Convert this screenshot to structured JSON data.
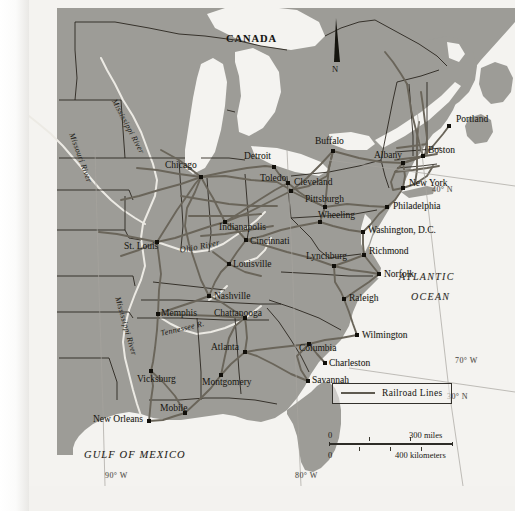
{
  "map": {
    "title_region": "Eastern United States Railroad Network",
    "colors": {
      "land": "#9d9c97",
      "water": "#f4f3f0",
      "railroad": "#6a655a",
      "border": "#231f18",
      "river": "#efeee9",
      "text": "#16150f"
    }
  },
  "labels": {
    "country": "CANADA",
    "ocean_line1": "ATLANTIC",
    "ocean_line2": "OCEAN",
    "gulf": "GULF OF MEXICO",
    "north": "N"
  },
  "rivers": [
    {
      "name": "Mississippi River",
      "x": 88,
      "y": 98,
      "rot": 62,
      "size": 8
    },
    {
      "name": "Missouri River",
      "x": 46,
      "y": 132,
      "rot": 70,
      "size": 8
    },
    {
      "name": "Mississippi River",
      "x": 92,
      "y": 296,
      "rot": 74,
      "size": 8
    },
    {
      "name": "Ohio River",
      "x": 150,
      "y": 246,
      "rot": -11,
      "size": 8.5
    },
    {
      "name": "Tennessee R.",
      "x": 131,
      "y": 330,
      "rot": -13,
      "size": 8
    }
  ],
  "graticule": [
    {
      "label": "40° N",
      "x": 432,
      "y": 186
    },
    {
      "label": "30° N",
      "x": 447,
      "y": 393
    },
    {
      "label": "70° W",
      "x": 455,
      "y": 357
    },
    {
      "label": "80° W",
      "x": 295,
      "y": 472
    },
    {
      "label": "90° W",
      "x": 105,
      "y": 472
    }
  ],
  "cities": [
    {
      "name": "Chicago",
      "lx": 136,
      "ly": 166,
      "dx": 172,
      "dy": 177
    },
    {
      "name": "Detroit",
      "lx": 215,
      "ly": 157,
      "dx": 245,
      "dy": 167
    },
    {
      "name": "Toledo",
      "lx": 231,
      "ly": 179,
      "dx": 259,
      "dy": 183
    },
    {
      "name": "Cleveland",
      "lx": 265,
      "ly": 183,
      "dx": 262,
      "dy": 191
    },
    {
      "name": "Buffalo",
      "lx": 286,
      "ly": 142,
      "dx": 304,
      "dy": 151
    },
    {
      "name": "Albany",
      "lx": 345,
      "ly": 156,
      "dx": 374,
      "dy": 163
    },
    {
      "name": "Portland",
      "lx": 427,
      "ly": 120,
      "dx": 420,
      "dy": 126
    },
    {
      "name": "Boston",
      "lx": 399,
      "ly": 151,
      "dx": 394,
      "dy": 156
    },
    {
      "name": "New York",
      "lx": 380,
      "ly": 184,
      "dx": 374,
      "dy": 188
    },
    {
      "name": "Philadelphia",
      "lx": 364,
      "ly": 207,
      "dx": 358,
      "dy": 207
    },
    {
      "name": "Pittsburgh",
      "lx": 276,
      "ly": 200,
      "dx": 296,
      "dy": 207
    },
    {
      "name": "Wheeling",
      "lx": 289,
      "ly": 216,
      "dx": 291,
      "dy": 222
    },
    {
      "name": "Washington, D.C.",
      "lx": 339,
      "ly": 231,
      "dx": 334,
      "dy": 232
    },
    {
      "name": "Richmond",
      "lx": 340,
      "ly": 252,
      "dx": 335,
      "dy": 255
    },
    {
      "name": "Norfolk",
      "lx": 355,
      "ly": 275,
      "dx": 350,
      "dy": 274
    },
    {
      "name": "Lynchburg",
      "lx": 277,
      "ly": 257,
      "dx": 305,
      "dy": 266
    },
    {
      "name": "Raleigh",
      "lx": 320,
      "ly": 299,
      "dx": 315,
      "dy": 299
    },
    {
      "name": "Wilmington",
      "lx": 333,
      "ly": 336,
      "dx": 328,
      "dy": 335
    },
    {
      "name": "Columbia",
      "lx": 270,
      "ly": 349,
      "dx": 280,
      "dy": 344
    },
    {
      "name": "Charleston",
      "lx": 300,
      "ly": 364,
      "dx": 296,
      "dy": 363
    },
    {
      "name": "Savannah",
      "lx": 283,
      "ly": 381,
      "dx": 279,
      "dy": 381
    },
    {
      "name": "Atlanta",
      "lx": 182,
      "ly": 348,
      "dx": 216,
      "dy": 352
    },
    {
      "name": "Chattanooga",
      "lx": 185,
      "ly": 314,
      "dx": 216,
      "dy": 318
    },
    {
      "name": "Nashville",
      "lx": 185,
      "ly": 297,
      "dx": 180,
      "dy": 296
    },
    {
      "name": "Memphis",
      "lx": 132,
      "ly": 314,
      "dx": 129,
      "dy": 314
    },
    {
      "name": "Vicksburg",
      "lx": 108,
      "ly": 380,
      "dx": 122,
      "dy": 371
    },
    {
      "name": "Montgomery",
      "lx": 173,
      "ly": 383,
      "dx": 192,
      "dy": 375
    },
    {
      "name": "Mobile",
      "lx": 131,
      "ly": 409,
      "dx": 156,
      "dy": 413
    },
    {
      "name": "New Orleans",
      "lx": 64,
      "ly": 420,
      "dx": 120,
      "dy": 421
    },
    {
      "name": "Louisville",
      "lx": 204,
      "ly": 265,
      "dx": 200,
      "dy": 264
    },
    {
      "name": "Cincinnati",
      "lx": 221,
      "ly": 242,
      "dx": 217,
      "dy": 240
    },
    {
      "name": "Indianapolis",
      "lx": 190,
      "ly": 228,
      "dx": 196,
      "dy": 222
    },
    {
      "name": "St. Louis",
      "lx": 95,
      "ly": 247,
      "dx": 128,
      "dy": 242
    }
  ],
  "legend": {
    "entry_label": "Railroad Lines"
  },
  "scale": {
    "miles_zero": "0",
    "miles_max": "300 miles",
    "km_zero": "0",
    "km_max": "400 kilometers"
  }
}
